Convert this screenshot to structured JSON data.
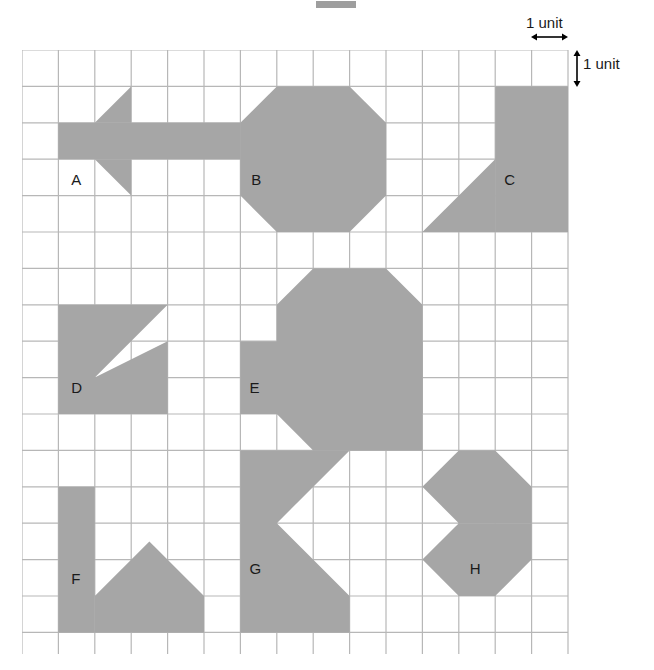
{
  "figure": {
    "title_mark": "",
    "grid": {
      "columns": 15,
      "rows": 17,
      "cell_px": 36.4,
      "origin_x": 22,
      "origin_y": 50,
      "line_color": "#b7b7b7",
      "background": "#ffffff"
    },
    "legend": {
      "horizontal_label": "1 unit",
      "vertical_label": "1 unit",
      "arrow_color": "#000000"
    },
    "shape_fill": "#a6a6a6",
    "label_color": "#1a1a1a",
    "shapes": [
      {
        "id": "A",
        "label": "A",
        "label_cell": [
          1.35,
          3.62
        ],
        "description": "arrow-like polygon: horizontal bar with two triangular wings",
        "points": "1,3 3,3 3,1 2,3 3,3 3,2 6,2 6,3 3,3 3,5 2,3 1,3",
        "polygons": [
          "1,2 6,2 6,3 1,3",
          "2,2 3,1 3,2",
          "2,3 3,3 3,4"
        ]
      },
      {
        "id": "B",
        "label": "B",
        "label_cell": [
          6.3,
          3.62
        ],
        "description": "regular octagon spanning 4 by 4 units with 1 unit corner cuts",
        "polygons": [
          "7,1 9,1 10,2 10,4 9,5 7,5 6,4 6,2"
        ]
      },
      {
        "id": "C",
        "label": "C",
        "label_cell": [
          13.25,
          3.62
        ],
        "description": "vertical rectangle with a right triangle attached at lower left",
        "polygons": [
          "13,1 15,1 15,5 13,5",
          "11,5 13,3 13,5"
        ]
      },
      {
        "id": "D",
        "label": "D",
        "label_cell": [
          1.35,
          9.35
        ],
        "description": "3 by 3 square with a thin triangular wedge removed from the upper right",
        "polygons": [
          "1,7 4,7 4,10 1,10",
          "2,9 4,7 4,8"
        ],
        "holes": [
          "2,9 4,7 4,8"
        ]
      },
      {
        "id": "E",
        "label": "E",
        "label_cell": [
          6.25,
          9.35
        ],
        "description": "octagon with horizontal rectangular bar extending both sides",
        "polygons": [
          "6,8 11,8 11,10 6,10",
          "8,6 10,6 11,7 11,11 10,11 8,11 7,10 7,7"
        ]
      },
      {
        "id": "F",
        "label": "F",
        "label_cell": [
          1.35,
          14.6
        ],
        "description": "tall rectangle on left, triangular peak in middle, bottom bar",
        "polygons": [
          "1,12 2,12 2,16 1,16",
          "2,15 5,15 5,16 2,16",
          "2,15 3.5,13.5 5,15"
        ]
      },
      {
        "id": "G",
        "label": "G",
        "label_cell": [
          6.25,
          14.3
        ],
        "description": "left pointing chevron block: rectangle with triangular notch cut from right side",
        "polygons": [
          "6,11 9,11 7,13 9,15 9,16 6,16"
        ]
      },
      {
        "id": "H",
        "label": "H",
        "label_cell": [
          12.3,
          14.3
        ],
        "description": "two hexagons stacked vertically meeting at a point",
        "polygons": [
          "12,11 13,11 14,12 14,13 12,13 11,12",
          "12,13 14,13 14,14 13,15 12,15 11,14"
        ]
      }
    ]
  }
}
